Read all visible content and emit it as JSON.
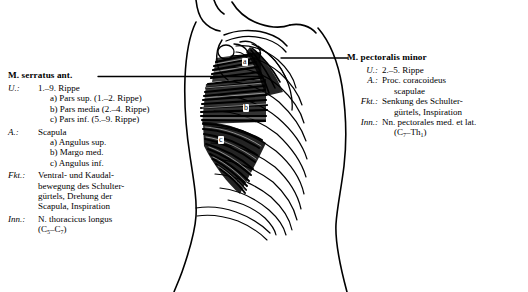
{
  "plate": {
    "title_left": "M. serratus ant.",
    "title_right": "M. pectoralis minor"
  },
  "serratus": {
    "title": "M. serratus ant.",
    "origin_key": "U.:",
    "origin_value": "1.–9. Rippe",
    "origin_sub": [
      "a) Pars sup. (1.–2. Rippe)",
      "b) Pars media (2.–4. Rippe)",
      "c) Pars inf. (5.–9. Rippe)"
    ],
    "insertion_key": "A.:",
    "insertion_value": "Scapula",
    "insertion_sub": [
      "a) Angulus sup.",
      "b) Margo med.",
      "c) Angulus inf."
    ],
    "function_key": "Fkt.:",
    "function_lines": [
      "Ventral- und Kaudal-",
      "bewegung des Schulter-",
      "gürtels, Drehung der",
      "Scapula, Inspiration"
    ],
    "innervation_key": "Inn.:",
    "innervation_value": "N. thoracicus longus",
    "innervation_segments": "(C5–C7)"
  },
  "pectoralis": {
    "title": "M. pectoralis minor",
    "origin_key": "U.:",
    "origin_value": "2.–5. Rippe",
    "insertion_key": "A.:",
    "insertion_value": "Proc. coracoideus",
    "insertion_cont": "scapulae",
    "function_key": "Fkt.:",
    "function_lines": [
      "Senkung des Schulter-",
      "gürtels, Inspiration"
    ],
    "innervation_key": "Inn.:",
    "innervation_value": "Nn. pectorales med. et lat.",
    "innervation_segments": "(C7–Th1)"
  },
  "figure": {
    "label_a": "a",
    "label_b": "b",
    "label_c": "c",
    "ink_color": "#000000",
    "paper_color": "#ffffff"
  }
}
